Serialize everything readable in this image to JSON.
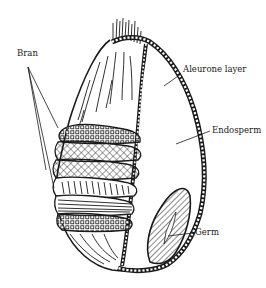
{
  "diagram": {
    "colors": {
      "ink": "#1a1a1a",
      "background": "#ffffff"
    },
    "labels": [
      {
        "id": "bran",
        "text": "Bran",
        "x": 17,
        "y": 49
      },
      {
        "id": "aleurone",
        "text": "Aleurone layer",
        "x": 183,
        "y": 65
      },
      {
        "id": "endosperm",
        "text": "Endosperm",
        "x": 212,
        "y": 126
      },
      {
        "id": "germ",
        "text": "Germ",
        "x": 195,
        "y": 228
      }
    ]
  }
}
